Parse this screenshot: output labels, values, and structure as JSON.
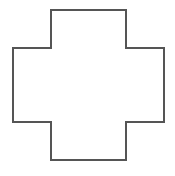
{
  "diagram": {
    "shape": "cross",
    "stroke_color": "#555555",
    "fill_color": "#ffffff",
    "stroke_width": 2,
    "points": "51,10 126,10 126,48 164,48 164,122 126,122 126,160 51,160 51,122 13,122 13,48 51,48"
  }
}
